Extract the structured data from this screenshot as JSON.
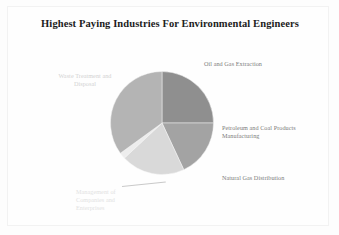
{
  "chart_data": {
    "type": "pie",
    "title": "Highest Paying Industries For Environmental Engineers",
    "xlabel": "",
    "ylabel": "",
    "legend_position": "none",
    "grid": false,
    "labels_outside": true,
    "categories": [
      "Oil and Gas Extraction",
      "Petroleum and Coal Products Manufacturing",
      "Natural Gas Distribution",
      "Management of Companies and Enterprises",
      "Waste Treatment and Disposal"
    ],
    "values": [
      25,
      18,
      20,
      2,
      35
    ],
    "colors": [
      "#8f8f8f",
      "#a3a3a3",
      "#d9d9d9",
      "#ededed",
      "#b4b4b4"
    ],
    "slices": [
      {
        "label": "Oil and Gas Extraction",
        "value": 25,
        "color": "#8f8f8f",
        "start_angle": 0,
        "end_angle": 90
      },
      {
        "label": "Petroleum and Coal Products Manufacturing",
        "value": 18,
        "color": "#a3a3a3",
        "start_angle": 90,
        "end_angle": 155
      },
      {
        "label": "Natural Gas Distribution",
        "value": 20,
        "color": "#d9d9d9",
        "start_angle": 155,
        "end_angle": 227
      },
      {
        "label": "Management of Companies and Enterprises",
        "value": 2,
        "color": "#ededed",
        "start_angle": 227,
        "end_angle": 234
      },
      {
        "label": "Waste Treatment and Disposal",
        "value": 35,
        "color": "#b4b4b4",
        "start_angle": 234,
        "end_angle": 360
      }
    ]
  },
  "chart": {
    "title": "Highest Paying Industries For Environmental Engineers",
    "labels": {
      "oil_gas_extraction": "Oil and Gas Extraction",
      "petroleum_coal": "Petroleum and Coal Products Manufacturing",
      "natural_gas": "Natural Gas Distribution",
      "management_companies": "Management of Companies and Enterprises",
      "waste_treatment": "Waste Treatment and Disposal"
    }
  }
}
